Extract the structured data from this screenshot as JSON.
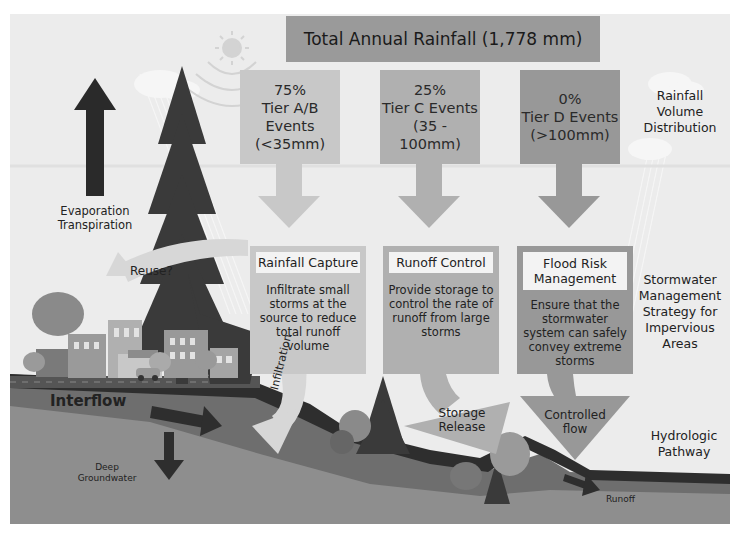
{
  "title": "Total Annual Rainfall (1,778 mm)",
  "tiers": [
    {
      "percent": "75%",
      "name": "Tier A/B Events",
      "range": "(<35mm)",
      "color": "#c8c8c8"
    },
    {
      "percent": "25%",
      "name": "Tier C Events",
      "range": "(35 - 100mm)",
      "color": "#b0b0b0"
    },
    {
      "percent": "0%",
      "name": "Tier D Events",
      "range": "(>100mm)",
      "color": "#989898"
    }
  ],
  "strategies": [
    {
      "header": "Rainfall Capture",
      "body": "Infiltrate small storms at the source to reduce total runoff volume"
    },
    {
      "header": "Runoff Control",
      "body": "Provide storage to control the rate of runoff from large storms"
    },
    {
      "header": "Flood Risk Management",
      "body": "Ensure that the stormwater system can safely convey extreme storms"
    }
  ],
  "row_labels": {
    "rainfall": "Rainfall Volume Distribution",
    "strategy": "Stormwater Management Strategy for Impervious Areas",
    "pathway": "Hydrologic Pathway"
  },
  "pathway_labels": {
    "evaporation": "Evaporation Transpiration",
    "reuse": "Reuse?",
    "interflow": "Interflow",
    "deep_groundwater": "Deep Groundwater",
    "infiltration": "Infiltration",
    "storage_release": "Storage Release",
    "controlled_flow": "Controlled flow",
    "runoff": "Runoff",
    "market_sign": "MARKET"
  },
  "colors": {
    "background": "#ececec",
    "ground_light": "#8e8e8e",
    "ground_mid": "#6e6e6e",
    "ground_dark": "#2e2e2e",
    "tree": "#3a3a3a"
  }
}
